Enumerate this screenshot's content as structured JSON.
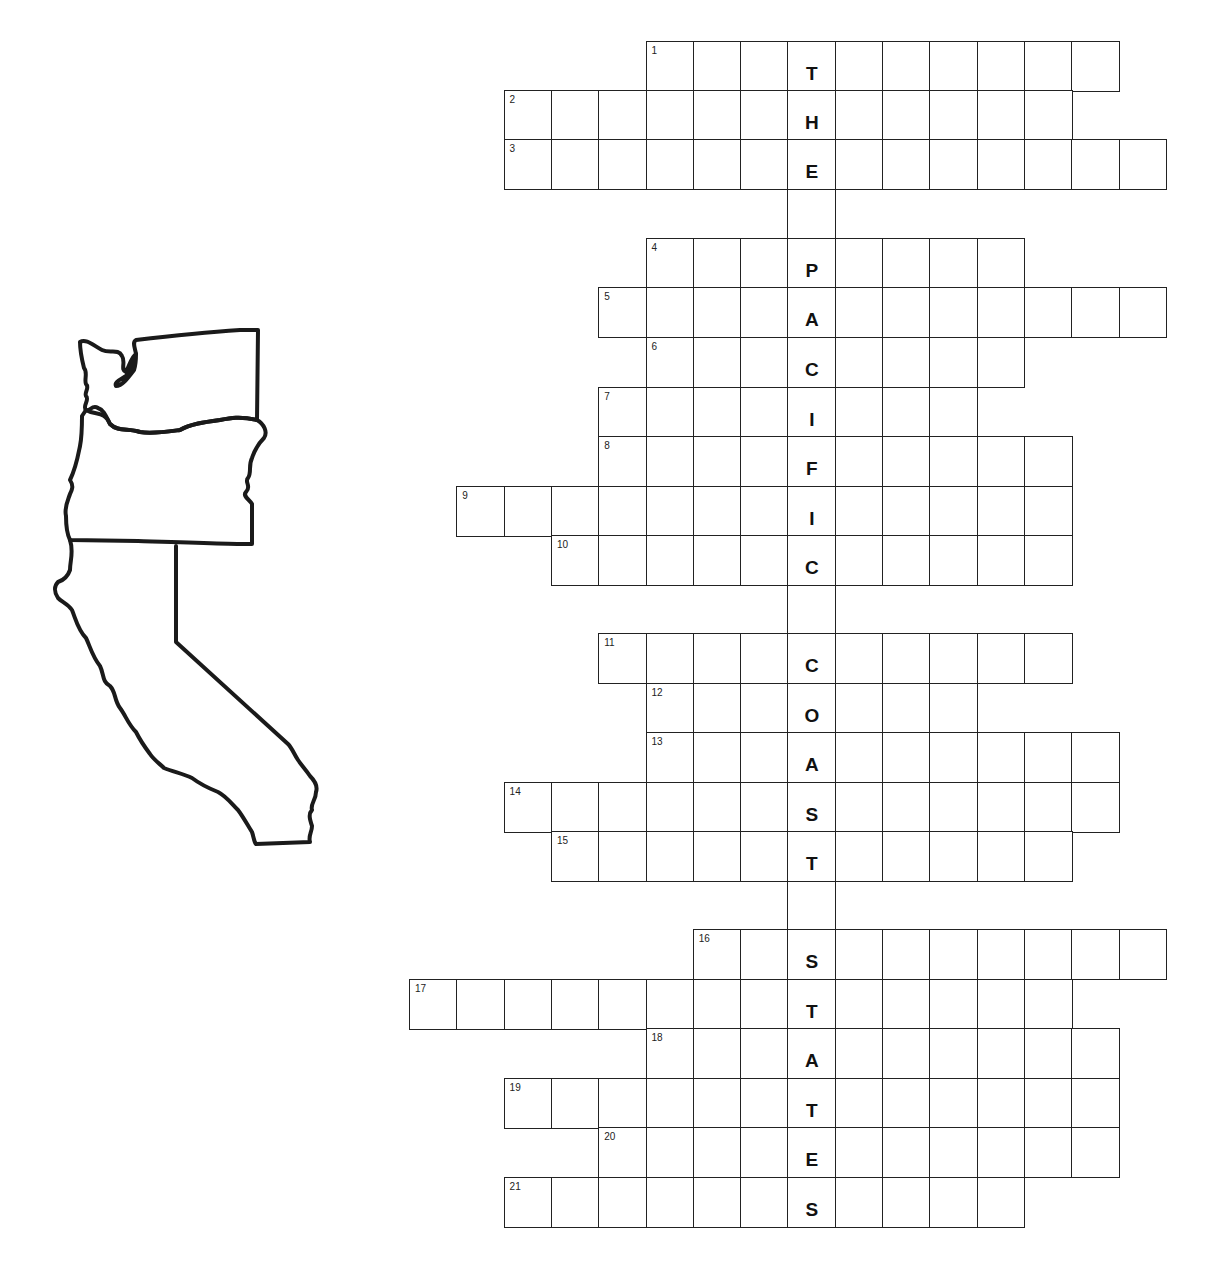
{
  "puzzle": {
    "theme_letters": "THE PACIFIC COAST STATES",
    "map_label": "Washington, Oregon, California outline",
    "grid": {
      "cell_width": 47.3,
      "row_height": 49.4,
      "col_origin_x": 409,
      "key_col_index": 8,
      "rows": [
        {
          "number": "1",
          "start_col": 5,
          "length": 10,
          "key_letter": "T",
          "top": 41
        },
        {
          "number": "2",
          "start_col": 2,
          "length": 12,
          "key_letter": "H",
          "top": 90
        },
        {
          "number": "3",
          "start_col": 2,
          "length": 14,
          "key_letter": "E",
          "top": 139
        },
        {
          "number": "4",
          "start_col": 5,
          "length": 8,
          "key_letter": "P",
          "top": 238
        },
        {
          "number": "5",
          "start_col": 4,
          "length": 12,
          "key_letter": "A",
          "top": 287
        },
        {
          "number": "6",
          "start_col": 5,
          "length": 8,
          "key_letter": "C",
          "top": 337
        },
        {
          "number": "7",
          "start_col": 4,
          "length": 8,
          "key_letter": "I",
          "top": 387
        },
        {
          "number": "8",
          "start_col": 4,
          "length": 10,
          "key_letter": "F",
          "top": 436
        },
        {
          "number": "9",
          "start_col": 1,
          "length": 13,
          "key_letter": "I",
          "top": 486
        },
        {
          "number": "10",
          "start_col": 3,
          "length": 11,
          "key_letter": "C",
          "top": 535
        },
        {
          "number": "11",
          "start_col": 4,
          "length": 10,
          "key_letter": "C",
          "top": 633
        },
        {
          "number": "12",
          "start_col": 5,
          "length": 7,
          "key_letter": "O",
          "top": 683
        },
        {
          "number": "13",
          "start_col": 5,
          "length": 10,
          "key_letter": "A",
          "top": 732
        },
        {
          "number": "14",
          "start_col": 2,
          "length": 13,
          "key_letter": "S",
          "top": 782
        },
        {
          "number": "15",
          "start_col": 3,
          "length": 11,
          "key_letter": "T",
          "top": 831
        },
        {
          "number": "16",
          "start_col": 6,
          "length": 10,
          "key_letter": "S",
          "top": 929
        },
        {
          "number": "17",
          "start_col": 0,
          "length": 14,
          "key_letter": "T",
          "top": 979
        },
        {
          "number": "18",
          "start_col": 5,
          "length": 10,
          "key_letter": "A",
          "top": 1028
        },
        {
          "number": "19",
          "start_col": 2,
          "length": 13,
          "key_letter": "T",
          "top": 1078
        },
        {
          "number": "20",
          "start_col": 4,
          "length": 11,
          "key_letter": "E",
          "top": 1127
        },
        {
          "number": "21",
          "start_col": 2,
          "length": 11,
          "key_letter": "S",
          "top": 1177
        }
      ],
      "connectors": [
        {
          "top": 188,
          "height": 50
        },
        {
          "top": 584,
          "height": 49
        },
        {
          "top": 880,
          "height": 49
        }
      ]
    }
  }
}
